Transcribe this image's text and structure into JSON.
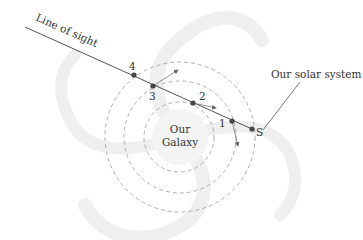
{
  "diagram": {
    "labels": {
      "line_of_sight": "Line of sight",
      "solar_system": "Our solar system",
      "galaxy_line1": "Our",
      "galaxy_line2": "Galaxy",
      "sun": "S",
      "p1": "1",
      "p2": "2",
      "p3": "3",
      "p4": "4"
    },
    "colors": {
      "line": "#555555",
      "dot": "#444444",
      "orbit": "#999999",
      "spiral": "#eeeeee",
      "text": "#333333"
    },
    "orbits": [
      {
        "name": "inner",
        "cx": 179,
        "cy": 137,
        "r": 35
      },
      {
        "name": "middle",
        "cx": 180,
        "cy": 137,
        "r": 56
      },
      {
        "name": "outer",
        "cx": 180,
        "cy": 137,
        "r": 75
      }
    ],
    "points": [
      {
        "label": "1",
        "x": 232,
        "y": 121
      },
      {
        "label": "2",
        "x": 193,
        "y": 103
      },
      {
        "label": "3",
        "x": 153,
        "y": 86
      },
      {
        "label": "4",
        "x": 134,
        "y": 75
      },
      {
        "label": "S",
        "x": 252,
        "y": 129
      }
    ]
  }
}
